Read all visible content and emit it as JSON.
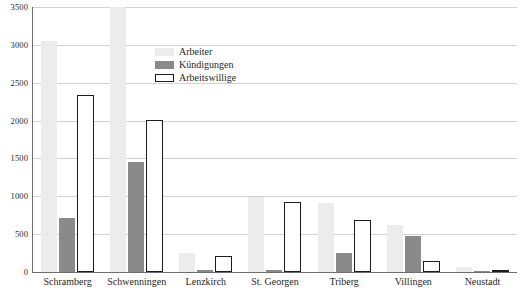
{
  "chart_data": {
    "type": "bar",
    "title": "",
    "subtitle": "",
    "xlabel": "",
    "ylabel": "",
    "ylim": [
      0,
      3500
    ],
    "ytick_step": 500,
    "yticks": [
      0,
      500,
      1000,
      1500,
      2000,
      2500,
      3000,
      3500
    ],
    "ytick_labels": [
      "0",
      "500",
      "1000",
      "1500",
      "2000",
      "2500",
      "3000",
      "3500"
    ],
    "grid": true,
    "legend_position": "inside-top-center",
    "categories": [
      "Schramberg",
      "Schwenningen",
      "Lenzkirch",
      "St. Georgen",
      "Triberg",
      "Villingen",
      "Neustadt"
    ],
    "series": [
      {
        "name": "Arbeiter",
        "color": "#ececec",
        "values": [
          3050,
          3500,
          250,
          990,
          910,
          620,
          60
        ]
      },
      {
        "name": "Kündigungen",
        "color": "#8a8a8a",
        "values": [
          720,
          1450,
          30,
          30,
          250,
          470,
          15
        ]
      },
      {
        "name": "Arbeitswillige",
        "color": "#ffffff",
        "border_color": "#1c1c1c",
        "values": [
          2340,
          2010,
          210,
          920,
          690,
          150,
          30
        ]
      }
    ]
  },
  "legend": {
    "items": [
      {
        "label": "Arbeiter",
        "swatch": "light-gray-filled"
      },
      {
        "label": "Kündigungen",
        "swatch": "dark-gray-filled"
      },
      {
        "label": "Arbeitswillige",
        "swatch": "white-outlined"
      }
    ]
  },
  "colors": {
    "arbeiter": "#ececec",
    "kuendigungen": "#8a8a8a",
    "arbeitswillige_fill": "#ffffff",
    "arbeitswillige_border": "#1c1c1c",
    "gridline": "#d2d2d2",
    "axis": "#6e6e6e",
    "text": "#1f1f1f",
    "background": "#ffffff"
  }
}
